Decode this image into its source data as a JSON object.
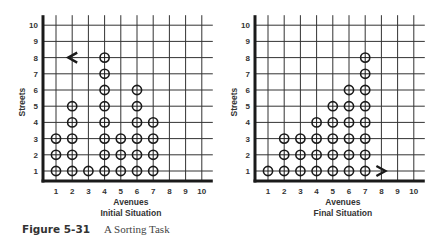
{
  "caption": {
    "number": "Figure 5-31",
    "title": "A Sorting Task"
  },
  "colors": {
    "ink": "#1a1a1a",
    "grid": "#333333",
    "text": "#333333"
  },
  "panels": [
    {
      "id": "initial",
      "subtitle": "Initial Situation",
      "xlabel": "Avenues",
      "ylabel": "Streets",
      "origin_x": 56,
      "origin_y": 171,
      "step": 16.2,
      "avenues": [
        1,
        2,
        3,
        4,
        5,
        6,
        7,
        8,
        9,
        10
      ],
      "streets": [
        1,
        2,
        3,
        4,
        5,
        6,
        7,
        8,
        9,
        10
      ],
      "beepers": [
        [
          1,
          1
        ],
        [
          1,
          2
        ],
        [
          1,
          3
        ],
        [
          2,
          1
        ],
        [
          2,
          2
        ],
        [
          2,
          3
        ],
        [
          2,
          4
        ],
        [
          2,
          5
        ],
        [
          3,
          1
        ],
        [
          4,
          1
        ],
        [
          4,
          2
        ],
        [
          4,
          3
        ],
        [
          4,
          4
        ],
        [
          4,
          5
        ],
        [
          4,
          6
        ],
        [
          4,
          7
        ],
        [
          4,
          8
        ],
        [
          5,
          1
        ],
        [
          5,
          2
        ],
        [
          5,
          3
        ],
        [
          6,
          1
        ],
        [
          6,
          2
        ],
        [
          6,
          3
        ],
        [
          6,
          4
        ],
        [
          6,
          5
        ],
        [
          6,
          6
        ],
        [
          7,
          1
        ],
        [
          7,
          2
        ],
        [
          7,
          3
        ],
        [
          7,
          4
        ]
      ],
      "robot": {
        "avenue": 2,
        "street": 8,
        "facing": "west"
      }
    },
    {
      "id": "final",
      "subtitle": "Final Situation",
      "xlabel": "Avenues",
      "ylabel": "Streets",
      "origin_x": 268,
      "origin_y": 171,
      "step": 16.2,
      "avenues": [
        1,
        2,
        3,
        4,
        5,
        6,
        7,
        8,
        9,
        10
      ],
      "streets": [
        1,
        2,
        3,
        4,
        5,
        6,
        7,
        8,
        9,
        10
      ],
      "beepers": [
        [
          1,
          1
        ],
        [
          2,
          1
        ],
        [
          2,
          2
        ],
        [
          2,
          3
        ],
        [
          3,
          1
        ],
        [
          3,
          2
        ],
        [
          3,
          3
        ],
        [
          4,
          1
        ],
        [
          4,
          2
        ],
        [
          4,
          3
        ],
        [
          4,
          4
        ],
        [
          5,
          1
        ],
        [
          5,
          2
        ],
        [
          5,
          3
        ],
        [
          5,
          4
        ],
        [
          5,
          5
        ],
        [
          6,
          1
        ],
        [
          6,
          2
        ],
        [
          6,
          3
        ],
        [
          6,
          4
        ],
        [
          6,
          5
        ],
        [
          6,
          6
        ],
        [
          7,
          1
        ],
        [
          7,
          2
        ],
        [
          7,
          3
        ],
        [
          7,
          4
        ],
        [
          7,
          5
        ],
        [
          7,
          6
        ],
        [
          7,
          7
        ],
        [
          7,
          8
        ]
      ],
      "robot": {
        "avenue": 8,
        "street": 1,
        "facing": "east"
      }
    }
  ],
  "chart_data": [
    {
      "type": "scatter",
      "title": "Initial Situation",
      "xlabel": "Avenues",
      "ylabel": "Streets",
      "xlim": [
        1,
        10
      ],
      "ylim": [
        1,
        10
      ],
      "grid": true,
      "beeper_columns": {
        "1": 3,
        "2": 5,
        "3": 1,
        "4": 8,
        "5": 3,
        "6": 6,
        "7": 4
      },
      "robot": {
        "x": 2,
        "y": 8,
        "facing": "west"
      }
    },
    {
      "type": "scatter",
      "title": "Final Situation",
      "xlabel": "Avenues",
      "ylabel": "Streets",
      "xlim": [
        1,
        10
      ],
      "ylim": [
        1,
        10
      ],
      "grid": true,
      "beeper_columns": {
        "1": 1,
        "2": 3,
        "3": 3,
        "4": 4,
        "5": 5,
        "6": 6,
        "7": 8
      },
      "robot": {
        "x": 8,
        "y": 1,
        "facing": "east"
      }
    }
  ]
}
